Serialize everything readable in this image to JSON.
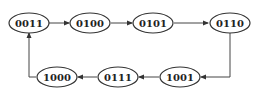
{
  "diagram": {
    "type": "state-transition",
    "nodes": [
      {
        "id": "s0",
        "label": "0011",
        "cx": 29,
        "cy": 23
      },
      {
        "id": "s1",
        "label": "0100",
        "cx": 90,
        "cy": 23
      },
      {
        "id": "s2",
        "label": "0101",
        "cx": 153,
        "cy": 23
      },
      {
        "id": "s3",
        "label": "0110",
        "cx": 230,
        "cy": 23
      },
      {
        "id": "s4",
        "label": "1001",
        "cx": 180,
        "cy": 77
      },
      {
        "id": "s5",
        "label": "0111",
        "cx": 118,
        "cy": 77
      },
      {
        "id": "s6",
        "label": "1000",
        "cx": 57,
        "cy": 77
      }
    ],
    "edges": [
      {
        "from": "0011",
        "to": "0100"
      },
      {
        "from": "0100",
        "to": "0101"
      },
      {
        "from": "0101",
        "to": "0110"
      },
      {
        "from": "0110",
        "to": "1001"
      },
      {
        "from": "1001",
        "to": "0111"
      },
      {
        "from": "0111",
        "to": "1000"
      },
      {
        "from": "1000",
        "to": "0011"
      }
    ],
    "colors": {
      "stroke": "#333333",
      "fill": "#ffffff",
      "text": "#222222"
    }
  }
}
